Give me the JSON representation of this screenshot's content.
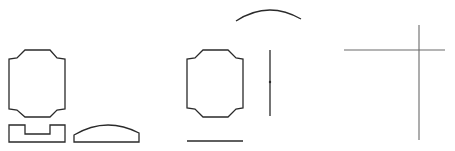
{
  "diagram": {
    "background": "#ffffff",
    "stroke_dark": "#2a2a2a",
    "stroke_gray": "#6a6a6a",
    "shapes": [
      {
        "name": "octagon-profile-left",
        "type": "polygon",
        "points": "25,50 50,50 57,58 65,59 65,109 57,110 50,117 25,117 17,110 9,109 9,59 17,58"
      },
      {
        "name": "channel-profile",
        "type": "polygon",
        "points": "9,125 25,125 25,134 50,134 50,125 65,125 65,142 9,142"
      },
      {
        "name": "dome-profile",
        "type": "path",
        "d": "M74,142 L74,135 Q106,116 139,133 L139,142 Z"
      },
      {
        "name": "octagon-profile-middle",
        "type": "polygon",
        "points": "203,50 228,50 236,58 243,59 243,108 236,109 228,117 203,117 195,109 187,108 187,59 195,58"
      },
      {
        "name": "arc-line",
        "type": "path",
        "d": "M236,21 Q268,0 301,19"
      },
      {
        "name": "vertical-line-middle",
        "type": "line",
        "x1": 270,
        "y1": 50,
        "x2": 270,
        "y2": 116
      },
      {
        "name": "horizontal-line-bottom",
        "type": "line",
        "x1": 187,
        "y1": 141,
        "x2": 243,
        "y2": 141
      },
      {
        "name": "crosshair-horizontal",
        "type": "line",
        "x1": 344,
        "y1": 50,
        "x2": 445,
        "y2": 50
      },
      {
        "name": "crosshair-vertical",
        "type": "line",
        "x1": 419,
        "y1": 25,
        "x2": 419,
        "y2": 140
      }
    ],
    "midpoint_dot": {
      "cx": 270,
      "cy": 82,
      "r": 1.2
    }
  }
}
